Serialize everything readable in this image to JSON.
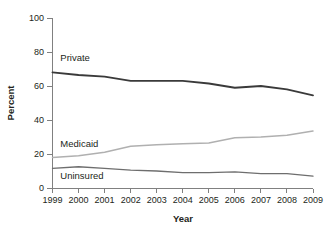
{
  "chart_data": {
    "type": "line",
    "title": "",
    "xlabel": "Year",
    "ylabel": "Percent",
    "categories": [
      "1999",
      "2000",
      "2001",
      "2002",
      "2003",
      "2004",
      "2005",
      "2006",
      "2007",
      "2008",
      "2009"
    ],
    "x": [
      1999,
      2000,
      2001,
      2002,
      2003,
      2004,
      2005,
      2006,
      2007,
      2008,
      2009
    ],
    "xlim": [
      1999,
      2009
    ],
    "ylim": [
      0,
      100
    ],
    "yticks": [
      0,
      20,
      40,
      60,
      80,
      100
    ],
    "ytick_labels": [
      "0",
      "20",
      "40",
      "60",
      "80",
      "100"
    ],
    "grid": false,
    "legend": "inline-labels",
    "series": [
      {
        "name": "Private",
        "color": "#3a3a3a",
        "width": 1.9,
        "values": [
          68,
          66.5,
          65.5,
          63,
          63,
          63,
          61.5,
          59,
          60,
          58,
          54.5
        ]
      },
      {
        "name": "Medicaid",
        "color": "#b0b0b0",
        "width": 1.5,
        "values": [
          18,
          19,
          21,
          24.5,
          25.5,
          26,
          26.5,
          29.5,
          30,
          31,
          33.5
        ]
      },
      {
        "name": "Uninsured",
        "color": "#6e6e6e",
        "width": 1.3,
        "values": [
          11.5,
          12.5,
          11.5,
          10.5,
          10,
          9,
          9,
          9.5,
          8.5,
          8.5,
          7
        ]
      }
    ],
    "annotations": [
      {
        "text": "Private",
        "x_year": 1999.3,
        "y_value": 75
      },
      {
        "text": "Medicaid",
        "x_year": 1999.3,
        "y_value": 24
      },
      {
        "text": "Uninsured",
        "x_year": 1999.3,
        "y_value": 5.5
      }
    ]
  },
  "axes": {
    "y_title": "Percent",
    "x_title": "Year"
  },
  "colors": {
    "axis": "#808080",
    "text": "#231f20",
    "private": "#3a3a3a",
    "medicaid": "#b0b0b0",
    "uninsured": "#6e6e6e",
    "background": "#ffffff"
  }
}
